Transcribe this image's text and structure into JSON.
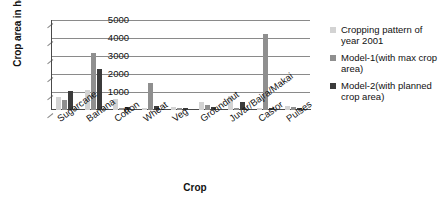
{
  "chart_data": {
    "type": "bar",
    "title": "",
    "xlabel": "Crop",
    "ylabel": "Crop area in ha",
    "ylim": [
      0,
      5000
    ],
    "ytick_values": [
      5000,
      4000,
      3000,
      2000,
      1000,
      0
    ],
    "yticks": [
      "5000",
      "4000",
      "3000",
      "2000",
      "1000",
      "0"
    ],
    "grid": true,
    "legend_position": "right",
    "categories": [
      "Sugarcane",
      "Banana",
      "Cotton",
      "Wheat",
      "Veg",
      "Groundnut",
      "Juvar/Bajra/Makai",
      "Castor",
      "Pulses"
    ],
    "series": [
      {
        "name": "Cropping pattern of year 2001",
        "color": "#d3d3d3",
        "values": [
          700,
          1100,
          620,
          130,
          150,
          450,
          770,
          130,
          200
        ]
      },
      {
        "name": "Model-1(with max crop area)",
        "color": "#8f8f8f",
        "values": [
          560,
          3150,
          110,
          1500,
          130,
          270,
          130,
          4200,
          170
        ]
      },
      {
        "name": "Model-2(with planned crop area)",
        "color": "#3b3b3b",
        "values": [
          1030,
          2280,
          170,
          250,
          130,
          150,
          420,
          110,
          100
        ]
      }
    ]
  },
  "legend": {
    "items": [
      {
        "label": "Cropping pattern of year 2001",
        "color": "#d3d3d3"
      },
      {
        "label": "Model-1(with max crop area)",
        "color": "#8f8f8f"
      },
      {
        "label": "Model-2(with planned crop area)",
        "color": "#3b3b3b"
      }
    ]
  }
}
